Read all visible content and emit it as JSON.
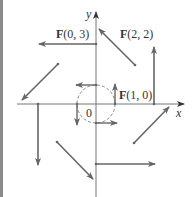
{
  "figure": {
    "axes": {
      "x_label": "x",
      "y_label": "y",
      "origin_label": "0"
    },
    "labels": {
      "f03": {
        "bold": "F",
        "rest": "(0, 3)"
      },
      "f22": {
        "bold": "F",
        "rest": "(2, 2)"
      },
      "f10": {
        "bold": "F",
        "rest": "(1, 0)"
      }
    },
    "vectors": [
      {
        "point": [
          0,
          3
        ],
        "vector": [
          -3,
          0
        ],
        "labeled": true
      },
      {
        "point": [
          2,
          2
        ],
        "vector": [
          -2,
          2
        ],
        "labeled": true
      },
      {
        "point": [
          3,
          0
        ],
        "vector": [
          0,
          3
        ],
        "labeled": false
      },
      {
        "point": [
          -2,
          2
        ],
        "vector": [
          -2,
          -2
        ],
        "labeled": false
      },
      {
        "point": [
          -3,
          0
        ],
        "vector": [
          0,
          -3
        ],
        "labeled": false
      },
      {
        "point": [
          -2,
          -2
        ],
        "vector": [
          2,
          -2
        ],
        "labeled": false
      },
      {
        "point": [
          0,
          -3
        ],
        "vector": [
          3,
          0
        ],
        "labeled": false
      },
      {
        "point": [
          2,
          -2
        ],
        "vector": [
          2,
          2
        ],
        "labeled": false
      },
      {
        "point": [
          1,
          0
        ],
        "vector": [
          0,
          1
        ],
        "labeled": true
      },
      {
        "point": [
          0,
          1
        ],
        "vector": [
          -1,
          0
        ],
        "labeled": false
      },
      {
        "point": [
          -1,
          0
        ],
        "vector": [
          0,
          -1
        ],
        "labeled": false
      },
      {
        "point": [
          0,
          -1
        ],
        "vector": [
          1,
          0
        ],
        "labeled": false
      }
    ],
    "unit_circle": {
      "radius": 1,
      "style": "dashed"
    },
    "colors": {
      "vector": "#666666",
      "axis": "#777777",
      "text": "#333333",
      "border": "#8a8a8a"
    }
  }
}
